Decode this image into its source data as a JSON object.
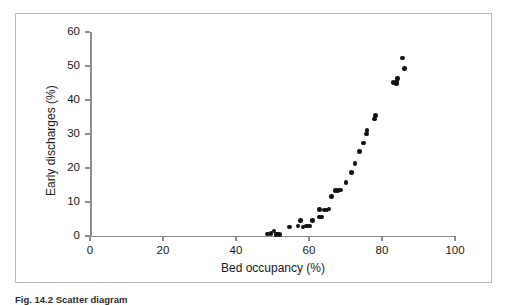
{
  "figure": {
    "caption": "Fig. 14.2 Scatter diagram",
    "border_color": "#b9b9b9",
    "point_color": "#111111",
    "axis_color": "#8c8c8c"
  },
  "chart_data": {
    "type": "scatter",
    "title": "",
    "xlabel": "Bed occupancy (%)",
    "ylabel": "Early discharges (%)",
    "xlim": [
      0,
      100
    ],
    "ylim": [
      0,
      60
    ],
    "xticks": [
      0,
      20,
      40,
      60,
      80,
      100
    ],
    "yticks": [
      0,
      10,
      20,
      30,
      40,
      50,
      60
    ],
    "xtick_labels": [
      "0",
      "20",
      "40",
      "60",
      "80",
      "100"
    ],
    "ytick_labels": [
      "0",
      "10",
      "20",
      "30",
      "40",
      "50",
      "60"
    ],
    "grid": false,
    "legend": null,
    "marker": "filled-circle",
    "points": [
      {
        "x": 48.6,
        "y": 0.6
      },
      {
        "x": 49.6,
        "y": 0.8
      },
      {
        "x": 50.4,
        "y": 1.5
      },
      {
        "x": 51.0,
        "y": 0.5
      },
      {
        "x": 51.4,
        "y": 0.6
      },
      {
        "x": 51.9,
        "y": 0.4
      },
      {
        "x": 54.6,
        "y": 2.6
      },
      {
        "x": 57.0,
        "y": 3.0
      },
      {
        "x": 57.6,
        "y": 4.6
      },
      {
        "x": 58.4,
        "y": 2.7
      },
      {
        "x": 59.3,
        "y": 3.0
      },
      {
        "x": 60.2,
        "y": 3.0
      },
      {
        "x": 61.0,
        "y": 4.6
      },
      {
        "x": 62.8,
        "y": 7.8
      },
      {
        "x": 62.9,
        "y": 5.6
      },
      {
        "x": 63.6,
        "y": 5.6
      },
      {
        "x": 64.3,
        "y": 7.6
      },
      {
        "x": 64.9,
        "y": 7.7
      },
      {
        "x": 65.5,
        "y": 8.0
      },
      {
        "x": 66.2,
        "y": 11.6
      },
      {
        "x": 67.3,
        "y": 13.3
      },
      {
        "x": 68.0,
        "y": 13.4
      },
      {
        "x": 68.7,
        "y": 13.5
      },
      {
        "x": 70.1,
        "y": 15.8
      },
      {
        "x": 71.6,
        "y": 18.6
      },
      {
        "x": 72.6,
        "y": 21.4
      },
      {
        "x": 73.8,
        "y": 24.8
      },
      {
        "x": 74.9,
        "y": 27.3
      },
      {
        "x": 75.8,
        "y": 30.0
      },
      {
        "x": 75.9,
        "y": 31.1
      },
      {
        "x": 77.9,
        "y": 34.4
      },
      {
        "x": 78.2,
        "y": 35.4
      },
      {
        "x": 83.2,
        "y": 45.2
      },
      {
        "x": 83.9,
        "y": 44.9
      },
      {
        "x": 84.1,
        "y": 45.4
      },
      {
        "x": 84.2,
        "y": 46.3
      },
      {
        "x": 85.6,
        "y": 52.3
      },
      {
        "x": 86.2,
        "y": 49.2
      }
    ]
  }
}
